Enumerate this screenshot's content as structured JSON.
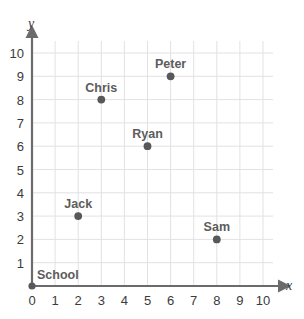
{
  "chart_data": {
    "type": "scatter",
    "title": "",
    "xlabel": "x",
    "ylabel": "y",
    "xlim": [
      0,
      10
    ],
    "ylim": [
      0,
      10
    ],
    "grid": true,
    "legend": "none",
    "x_ticks": [
      "0",
      "1",
      "2",
      "3",
      "4",
      "5",
      "6",
      "7",
      "8",
      "9",
      "10"
    ],
    "y_ticks": [
      "0",
      "1",
      "2",
      "3",
      "4",
      "5",
      "6",
      "7",
      "8",
      "9",
      "10"
    ],
    "points": [
      {
        "label": "School",
        "x": 0,
        "y": 0,
        "label_anchor": "left"
      },
      {
        "label": "Jack",
        "x": 2,
        "y": 3,
        "label_anchor": "center"
      },
      {
        "label": "Chris",
        "x": 3,
        "y": 8,
        "label_anchor": "center"
      },
      {
        "label": "Ryan",
        "x": 5,
        "y": 6,
        "label_anchor": "center"
      },
      {
        "label": "Peter",
        "x": 6,
        "y": 9,
        "label_anchor": "center"
      },
      {
        "label": "Sam",
        "x": 8,
        "y": 2,
        "label_anchor": "center"
      }
    ],
    "colors": {
      "point": "#58585a",
      "axis": "#6b6b6d",
      "grid": "#e2e2e4",
      "tick_text": "#3b3b3b",
      "point_label": "#5c5c5c",
      "background": "#ffffff"
    }
  }
}
